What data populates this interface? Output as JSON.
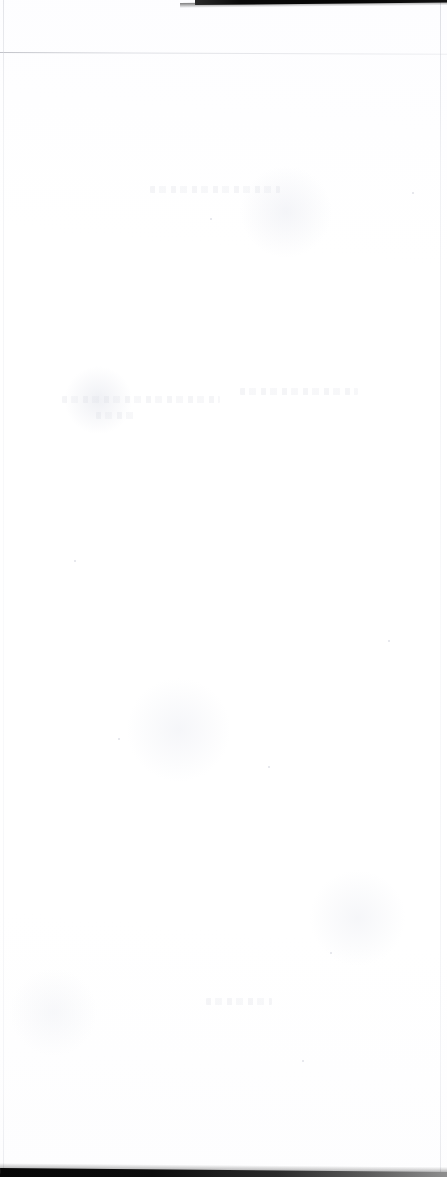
{
  "document": {
    "kind": "scanned-page",
    "title": "Scanned blank page",
    "page_width": 447,
    "page_height": 1177,
    "visible_text": "",
    "legible_content_present": false,
    "description": "A near-blank scanned sheet of paper. No legible text, headings, figures, tables, captions, page numbers or marginalia are rendered in the pixels."
  },
  "colors": {
    "page_background": "#ffffff",
    "paper_white": "#fdfdff",
    "scanner_band_dark": "#070707",
    "scanner_band_light": "#8e8e8e",
    "sheet_edge_rule": "#c6c8d0",
    "ghost_showthrough": "#d8dae2"
  },
  "artifacts": {
    "scan_band_top": {
      "name": "top scanner shadow band",
      "edge": "top",
      "starts_x": 195,
      "ends_x": 447,
      "thickness_px": 5,
      "slope_deg": -0.55,
      "note": "black scan-bed shadow along the upper right edge"
    },
    "scan_band_bottom": {
      "name": "bottom scanner shadow band",
      "edge": "bottom",
      "starts_x": 0,
      "ends_x": 447,
      "thickness_px": 9,
      "slope_deg": 0.5,
      "note": "dark at the left, fading toward the right edge"
    },
    "sheet_edge_top": {
      "name": "top sheet edge rule",
      "y": 52,
      "slope_deg": 0.22,
      "note": "faint grey hairline spanning the full width"
    },
    "sheet_edge_left": {
      "name": "left sheet edge rule",
      "x": 3,
      "note": "faint vertical hairline down the left side"
    },
    "sheet_edge_right": {
      "name": "right sheet edge rule",
      "x": 440,
      "note": "faint vertical hairline down the right side"
    },
    "ghost_marks": {
      "name": "reverse-side show-through",
      "note": "extremely faint, illegible ghosting of ink from the back of the sheet",
      "bands": [
        {
          "x": 150,
          "y": 186,
          "width": 130
        },
        {
          "x": 62,
          "y": 396,
          "width": 158
        },
        {
          "x": 240,
          "y": 388,
          "width": 118
        },
        {
          "x": 96,
          "y": 412,
          "width": 42
        },
        {
          "x": 206,
          "y": 998,
          "width": 66
        }
      ],
      "specks": [
        {
          "x": 118,
          "y": 738
        },
        {
          "x": 268,
          "y": 766
        },
        {
          "x": 210,
          "y": 218
        },
        {
          "x": 412,
          "y": 192
        },
        {
          "x": 330,
          "y": 952
        },
        {
          "x": 302,
          "y": 1060
        },
        {
          "x": 74,
          "y": 560
        },
        {
          "x": 388,
          "y": 640
        }
      ]
    }
  }
}
